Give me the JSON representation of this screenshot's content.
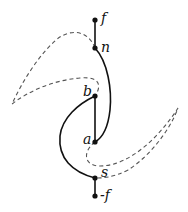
{
  "diagram": {
    "type": "curve-diagram",
    "colors": {
      "stroke": "#111111",
      "dashed": "#555555",
      "background": "#ffffff"
    },
    "nodes": [
      {
        "id": "f",
        "label": "f",
        "x": 95,
        "y": 20
      },
      {
        "id": "n",
        "label": "n",
        "x": 95,
        "y": 48
      },
      {
        "id": "b",
        "label": "b",
        "x": 95,
        "y": 96
      },
      {
        "id": "a",
        "label": "a",
        "x": 95,
        "y": 142
      },
      {
        "id": "s",
        "label": "s",
        "x": 95,
        "y": 178
      },
      {
        "id": "neg_f",
        "label": "-f",
        "x": 95,
        "y": 196
      }
    ],
    "edges": [
      {
        "from": "f",
        "to": "n",
        "style": "solid",
        "shape": "straight"
      },
      {
        "from": "n",
        "to": "a",
        "style": "solid",
        "shape": "curve-right"
      },
      {
        "from": "b",
        "to": "a",
        "style": "solid",
        "shape": "straight"
      },
      {
        "from": "b",
        "to": "s",
        "style": "solid",
        "shape": "curve-left"
      },
      {
        "from": "s",
        "to": "neg_f",
        "style": "solid",
        "shape": "straight"
      },
      {
        "from": "n",
        "to": "b",
        "style": "dashed",
        "shape": "loop-left"
      },
      {
        "from": "a",
        "to": "s",
        "style": "dashed",
        "shape": "loop-right"
      }
    ]
  }
}
